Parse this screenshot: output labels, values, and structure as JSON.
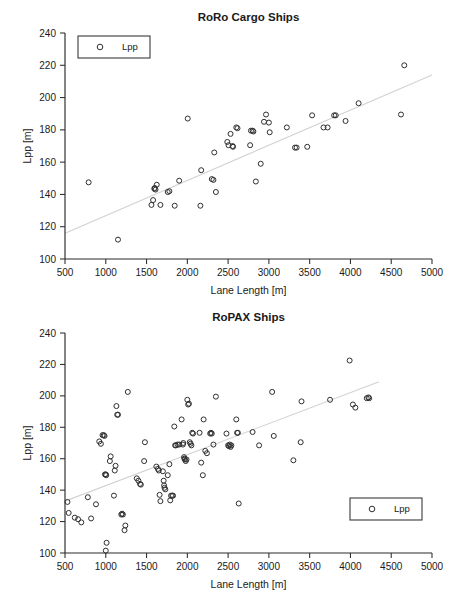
{
  "chart_data": [
    {
      "type": "scatter",
      "title": "RoRo Cargo Ships",
      "xlabel": "Lane Length [m]",
      "ylabel": "Lpp [m]",
      "xlim": [
        500,
        5000
      ],
      "ylim": [
        100,
        240
      ],
      "xticks": [
        500,
        1000,
        1500,
        2000,
        2500,
        3000,
        3500,
        4000,
        4500,
        5000
      ],
      "yticks": [
        100,
        120,
        140,
        160,
        180,
        200,
        220,
        240
      ],
      "grid": false,
      "legend": {
        "position": "top-left",
        "entries": [
          "Lpp"
        ],
        "marker": "open-circle"
      },
      "series": [
        {
          "name": "Lpp",
          "marker": "open-circle",
          "points": [
            [
              790,
              147.5
            ],
            [
              1150,
              112.0
            ],
            [
              1560,
              133.5
            ],
            [
              1580,
              136.5
            ],
            [
              1595,
              143.5
            ],
            [
              1600,
              144.0
            ],
            [
              1610,
              143.0
            ],
            [
              1625,
              146.0
            ],
            [
              1670,
              133.5
            ],
            [
              1760,
              141.5
            ],
            [
              1780,
              142.0
            ],
            [
              1845,
              133.0
            ],
            [
              1900,
              148.5
            ],
            [
              2005,
              187.0
            ],
            [
              2160,
              133.0
            ],
            [
              2170,
              155.0
            ],
            [
              2300,
              149.5
            ],
            [
              2320,
              149.0
            ],
            [
              2330,
              166.0
            ],
            [
              2350,
              141.5
            ],
            [
              2490,
              172.5
            ],
            [
              2505,
              170.5
            ],
            [
              2530,
              177.5
            ],
            [
              2555,
              170.0
            ],
            [
              2560,
              169.5
            ],
            [
              2600,
              181.5
            ],
            [
              2615,
              181.0
            ],
            [
              2770,
              170.5
            ],
            [
              2780,
              179.5
            ],
            [
              2800,
              179.5
            ],
            [
              2810,
              179.0
            ],
            [
              2840,
              148.0
            ],
            [
              2900,
              159.0
            ],
            [
              2940,
              185.0
            ],
            [
              2965,
              189.5
            ],
            [
              3000,
              184.5
            ],
            [
              3010,
              178.5
            ],
            [
              3220,
              181.5
            ],
            [
              3320,
              169.0
            ],
            [
              3340,
              169.0
            ],
            [
              3470,
              169.5
            ],
            [
              3530,
              189.0
            ],
            [
              3670,
              181.5
            ],
            [
              3720,
              181.5
            ],
            [
              3800,
              189.0
            ],
            [
              3820,
              189.0
            ],
            [
              3940,
              185.5
            ],
            [
              4100,
              196.5
            ],
            [
              4620,
              189.5
            ],
            [
              4660,
              220.0
            ]
          ]
        }
      ],
      "trendline": {
        "from": [
          500,
          116.0
        ],
        "to": [
          5000,
          214.0
        ],
        "color": "#d2d2d2"
      }
    },
    {
      "type": "scatter",
      "title": "RoPAX Ships",
      "xlabel": "Lane Length [m]",
      "ylabel": "Lpp [m]",
      "xlim": [
        500,
        5000
      ],
      "ylim": [
        100,
        240
      ],
      "xticks": [
        500,
        1000,
        1500,
        2000,
        2500,
        3000,
        3500,
        4000,
        4500,
        5000
      ],
      "yticks": [
        100,
        120,
        140,
        160,
        180,
        200,
        220,
        240
      ],
      "grid": false,
      "legend": {
        "position": "bottom-right",
        "entries": [
          "Lpp"
        ],
        "marker": "open-circle"
      },
      "series": [
        {
          "name": "Lpp",
          "marker": "open-circle",
          "points": [
            [
              530,
              132.5
            ],
            [
              545,
              125.5
            ],
            [
              620,
              122.5
            ],
            [
              660,
              121.5
            ],
            [
              700,
              119.5
            ],
            [
              780,
              135.5
            ],
            [
              820,
              122.0
            ],
            [
              880,
              131.0
            ],
            [
              920,
              171.0
            ],
            [
              940,
              169.5
            ],
            [
              960,
              175.0
            ],
            [
              975,
              175.0
            ],
            [
              985,
              174.5
            ],
            [
              990,
              150.0
            ],
            [
              1000,
              150.0
            ],
            [
              1005,
              149.5
            ],
            [
              1000,
              101.5
            ],
            [
              1010,
              106.5
            ],
            [
              1050,
              158.5
            ],
            [
              1060,
              161.5
            ],
            [
              1100,
              136.5
            ],
            [
              1110,
              152.5
            ],
            [
              1120,
              155.5
            ],
            [
              1130,
              193.5
            ],
            [
              1140,
              188.0
            ],
            [
              1150,
              188.0
            ],
            [
              1190,
              124.5
            ],
            [
              1200,
              125.0
            ],
            [
              1210,
              124.5
            ],
            [
              1230,
              114.5
            ],
            [
              1240,
              117.5
            ],
            [
              1270,
              202.5
            ],
            [
              1380,
              147.5
            ],
            [
              1400,
              146.0
            ],
            [
              1420,
              144.0
            ],
            [
              1430,
              143.5
            ],
            [
              1480,
              170.5
            ],
            [
              1470,
              158.5
            ],
            [
              1620,
              155.0
            ],
            [
              1640,
              153.5
            ],
            [
              1650,
              152.5
            ],
            [
              1660,
              137.0
            ],
            [
              1670,
              133.0
            ],
            [
              1700,
              152.0
            ],
            [
              1710,
              146.0
            ],
            [
              1715,
              143.0
            ],
            [
              1720,
              141.5
            ],
            [
              1730,
              140.5
            ],
            [
              1760,
              149.5
            ],
            [
              1780,
              156.5
            ],
            [
              1790,
              133.5
            ],
            [
              1800,
              136.5
            ],
            [
              1815,
              136.5
            ],
            [
              1825,
              136.5
            ],
            [
              1840,
              180.5
            ],
            [
              1850,
              168.5
            ],
            [
              1860,
              168.5
            ],
            [
              1880,
              169.0
            ],
            [
              1900,
              169.0
            ],
            [
              1930,
              185.0
            ],
            [
              1945,
              169.0
            ],
            [
              1950,
              170.0
            ],
            [
              1960,
              161.0
            ],
            [
              1965,
              160.0
            ],
            [
              1970,
              159.5
            ],
            [
              1980,
              158.5
            ],
            [
              1990,
              159.5
            ],
            [
              2000,
              197.5
            ],
            [
              2010,
              194.5
            ],
            [
              2020,
              195.0
            ],
            [
              2030,
              170.5
            ],
            [
              2040,
              169.5
            ],
            [
              2050,
              168.5
            ],
            [
              2060,
              176.5
            ],
            [
              2070,
              176.0
            ],
            [
              2150,
              176.5
            ],
            [
              2170,
              157.5
            ],
            [
              2190,
              149.5
            ],
            [
              2200,
              185.0
            ],
            [
              2220,
              165.0
            ],
            [
              2240,
              163.5
            ],
            [
              2280,
              176.0
            ],
            [
              2290,
              176.5
            ],
            [
              2300,
              176.0
            ],
            [
              2320,
              169.0
            ],
            [
              2350,
              199.5
            ],
            [
              2480,
              176.0
            ],
            [
              2500,
              168.5
            ],
            [
              2510,
              168.0
            ],
            [
              2520,
              169.0
            ],
            [
              2530,
              167.5
            ],
            [
              2540,
              168.5
            ],
            [
              2600,
              185.0
            ],
            [
              2610,
              176.5
            ],
            [
              2620,
              176.5
            ],
            [
              2630,
              131.5
            ],
            [
              2800,
              177.0
            ],
            [
              2880,
              168.5
            ],
            [
              3040,
              202.5
            ],
            [
              3060,
              174.5
            ],
            [
              3300,
              159.0
            ],
            [
              3400,
              196.5
            ],
            [
              3390,
              170.5
            ],
            [
              3750,
              197.5
            ],
            [
              3990,
              222.5
            ],
            [
              4030,
              194.5
            ],
            [
              4060,
              192.5
            ],
            [
              4200,
              198.5
            ],
            [
              4220,
              199.0
            ],
            [
              4230,
              198.5
            ]
          ]
        }
      ],
      "trendline": {
        "from": [
          500,
          133.0
        ],
        "to": [
          4350,
          209.0
        ],
        "color": "#d2d2d2"
      }
    }
  ]
}
